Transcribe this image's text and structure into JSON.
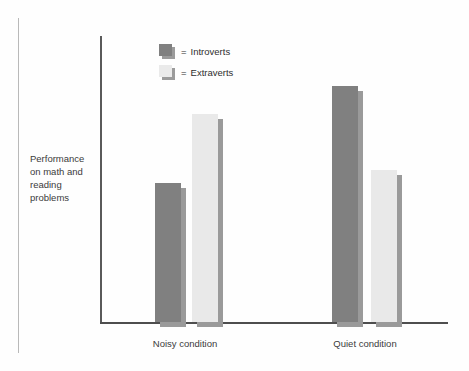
{
  "figure": {
    "y_axis_caption_lines": [
      "Performance",
      "on math and",
      "reading",
      "problems"
    ],
    "equals_sign": "="
  },
  "legend": {
    "items": [
      {
        "label": "Introverts",
        "color": "#808080"
      },
      {
        "label": "Extraverts",
        "color": "#e9e9e9"
      }
    ]
  },
  "chart_data": {
    "type": "bar",
    "title": "",
    "subtitle": "",
    "xlabel": "",
    "ylabel": "Performance on math and reading problems",
    "categories": [
      "Noisy condition",
      "Quiet condition"
    ],
    "series": [
      {
        "name": "Introverts",
        "color": "#808080",
        "values": [
          48.6,
          82.6
        ]
      },
      {
        "name": "Extraverts",
        "color": "#e9e9e9",
        "values": [
          72.6,
          53.1
        ]
      }
    ],
    "ylim": [
      0,
      100
    ],
    "grid": false,
    "axis_ticks_visible": false,
    "legend_position": "inside-top-left"
  }
}
